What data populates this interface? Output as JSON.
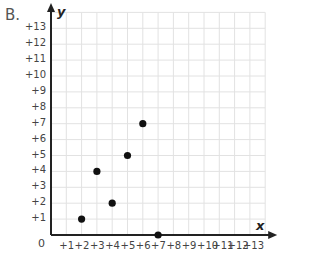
{
  "part_label": "B.",
  "chart_data": {
    "type": "scatter",
    "title": "",
    "xlabel": "x",
    "ylabel": "y",
    "xlim": [
      0,
      14
    ],
    "ylim": [
      0,
      14
    ],
    "grid": true,
    "origin_label": "0",
    "x_ticks": [
      "+1",
      "+2",
      "+3",
      "+4",
      "+5",
      "+6",
      "+7",
      "+8",
      "+9",
      "+10",
      "+11",
      "+12",
      "+13"
    ],
    "y_ticks": [
      "+1",
      "+2",
      "+3",
      "+4",
      "+5",
      "+6",
      "+7",
      "+8",
      "+9",
      "+10",
      "+11",
      "+12",
      "+13"
    ],
    "points": [
      {
        "x": 2,
        "y": 1
      },
      {
        "x": 3,
        "y": 4
      },
      {
        "x": 4,
        "y": 2
      },
      {
        "x": 5,
        "y": 5
      },
      {
        "x": 6,
        "y": 7
      },
      {
        "x": 7,
        "y": 0
      }
    ],
    "colors": {
      "grid": "#e2e2e2",
      "axis": "#222222",
      "point": "#111111"
    }
  }
}
